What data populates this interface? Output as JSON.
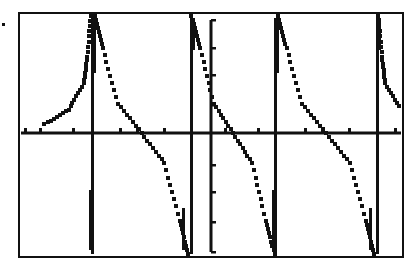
{
  "chart_data": {
    "type": "line",
    "title": "",
    "xlabel": "",
    "ylabel": "",
    "function": "y = cot(x)",
    "grid": false,
    "legend": null,
    "xlim": [
      -6.28,
      6.28
    ],
    "ylim": [
      -4,
      4
    ],
    "xscale_ticks": 1,
    "yscale_ticks": 1,
    "asymptotes_x": [
      -4.71,
      -1.57,
      1.57,
      4.71
    ],
    "zeros_x": [
      -3.14,
      0,
      3.14
    ],
    "series": [
      {
        "name": "y1",
        "branches": [
          {
            "x": [
              -6.28,
              -5.5,
              -5.0,
              -4.9,
              -4.78
            ],
            "y": [
              0.3,
              0.8,
              1.7,
              2.6,
              4.0
            ]
          },
          {
            "x": [
              -4.66,
              -4.4,
              -3.9,
              -3.14,
              -2.4,
              -1.9,
              -1.62
            ],
            "y": [
              4.0,
              2.9,
              1.0,
              0.0,
              -1.0,
              -2.9,
              -4.0
            ]
          },
          {
            "x": [
              -1.52,
              -1.2,
              -0.7,
              0.0,
              0.7,
              1.2,
              1.52
            ],
            "y": [
              4.0,
              2.9,
              1.0,
              0.0,
              -1.0,
              -2.9,
              -4.0
            ]
          },
          {
            "x": [
              1.62,
              1.9,
              2.4,
              3.14,
              3.9,
              4.4,
              4.66
            ],
            "y": [
              4.0,
              2.9,
              1.0,
              0.0,
              -1.0,
              -2.9,
              -4.0
            ]
          },
          {
            "x": [
              4.78,
              4.9,
              5.0,
              5.5,
              6.28
            ],
            "y": [
              4.0,
              2.6,
              1.7,
              0.8,
              0.3
            ]
          }
        ]
      }
    ]
  },
  "screen": {
    "frame": {
      "left": 19,
      "top": 13,
      "right": 403,
      "bottom": 257
    },
    "axes": {
      "x_axis_y": 133,
      "y_axis_x": 211
    },
    "colors": {
      "ink": "#111111",
      "background": "#ffffff"
    },
    "marker_dot": {
      "x": 3,
      "y": 24
    }
  }
}
